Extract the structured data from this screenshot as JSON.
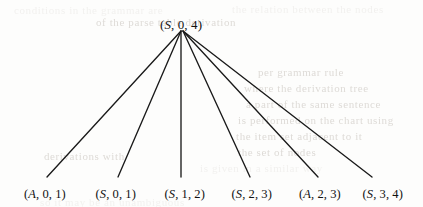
{
  "figure": {
    "type": "tree-diagram",
    "root": {
      "id": "root",
      "label": "(S, 0, 4)",
      "symbol": "S",
      "values": [
        0,
        4
      ],
      "x": 181,
      "y": 18
    },
    "leaves": [
      {
        "id": "leaf-1",
        "label": "(A, 0, 1)",
        "symbol": "A",
        "values": [
          0,
          1
        ],
        "x": 45,
        "y": 188
      },
      {
        "id": "leaf-2",
        "label": "(S, 0, 1)",
        "symbol": "S",
        "values": [
          0,
          1
        ],
        "x": 116,
        "y": 188
      },
      {
        "id": "leaf-3",
        "label": "(S, 1, 2)",
        "symbol": "S",
        "values": [
          1,
          2
        ],
        "x": 185,
        "y": 188
      },
      {
        "id": "leaf-4",
        "label": "(S, 2, 3)",
        "symbol": "S",
        "values": [
          2,
          3
        ],
        "x": 252,
        "y": 188
      },
      {
        "id": "leaf-5",
        "label": "(A, 2, 3)",
        "symbol": "A",
        "values": [
          2,
          3
        ],
        "x": 320,
        "y": 188
      },
      {
        "id": "leaf-6",
        "label": "(S, 3, 4)",
        "symbol": "S",
        "values": [
          3,
          4
        ],
        "x": 383,
        "y": 188
      }
    ],
    "edges": [
      {
        "id": "edge-1",
        "from": "root",
        "to": "leaf-1",
        "x1": 181,
        "y1": 31,
        "x2": 47,
        "y2": 177
      },
      {
        "id": "edge-2",
        "from": "root",
        "to": "leaf-2",
        "x1": 181,
        "y1": 31,
        "x2": 118,
        "y2": 177
      },
      {
        "id": "edge-3",
        "from": "root",
        "to": "leaf-3",
        "x1": 181,
        "y1": 31,
        "x2": 181,
        "y2": 177
      },
      {
        "id": "edge-4",
        "from": "root",
        "to": "leaf-4",
        "x1": 183,
        "y1": 31,
        "x2": 250,
        "y2": 177
      },
      {
        "id": "edge-5",
        "from": "root",
        "to": "leaf-5",
        "x1": 183,
        "y1": 31,
        "x2": 318,
        "y2": 177
      },
      {
        "id": "edge-6",
        "from": "root",
        "to": "leaf-6",
        "x1": 183,
        "y1": 31,
        "x2": 372,
        "y2": 177
      }
    ],
    "colors": {
      "background": "#fdfdfc",
      "ink": "#111111",
      "edge": "#1a1a1a",
      "ghost": "#e7e5e2"
    }
  },
  "background_ghost_text": {
    "note": "faint bleed-through from reverse page; illegible in scan",
    "lines": [
      {
        "text": "conditions  in  the  grammar  are",
        "x": 14,
        "y": 4,
        "tone": "faint"
      },
      {
        "text": "the  relation  between  the  nodes",
        "x": 232,
        "y": 3,
        "tone": "faint"
      },
      {
        "text": "of  the  parse  table  derivation",
        "x": 96,
        "y": 16,
        "tone": "strong"
      },
      {
        "text": "per  grammar  rule",
        "x": 258,
        "y": 66,
        "tone": "strong"
      },
      {
        "text": "where  the  derivation  tree",
        "x": 244,
        "y": 82,
        "tone": "strong"
      },
      {
        "text": "a  part  of  the  same  sentence",
        "x": 246,
        "y": 98,
        "tone": "strong"
      },
      {
        "text": "is  performed  on  the  chart  using",
        "x": 238,
        "y": 114,
        "tone": "strong"
      },
      {
        "text": "the  item  set  adjacent  to  it",
        "x": 236,
        "y": 130,
        "tone": "strong"
      },
      {
        "text": "the  set  of  nodes",
        "x": 238,
        "y": 146,
        "tone": "strong"
      },
      {
        "text": "derivations  with",
        "x": 44,
        "y": 150,
        "tone": "strong"
      },
      {
        "text": "is  given  in  a  similar  way",
        "x": 200,
        "y": 162,
        "tone": "faint"
      },
      {
        "text": "so  it  may  be  an  unambiguous",
        "x": 40,
        "y": 196,
        "tone": "faint"
      }
    ]
  }
}
